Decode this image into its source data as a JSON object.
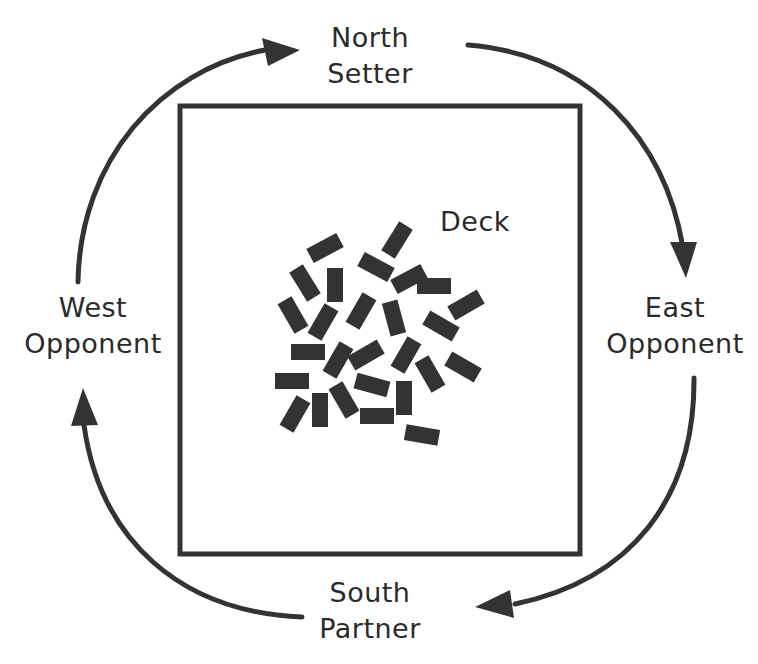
{
  "diagram": {
    "title": "",
    "players": {
      "north": {
        "position": "North",
        "role": "Setter"
      },
      "east": {
        "position": "East",
        "role": "Opponent"
      },
      "south": {
        "position": "South",
        "role": "Partner"
      },
      "west": {
        "position": "West",
        "role": "Opponent"
      }
    },
    "center": {
      "label": "Deck"
    },
    "play_direction": "clockwise",
    "flow": [
      "North",
      "East",
      "South",
      "West"
    ],
    "colors": {
      "ink": "#2a2a2a",
      "tile": "#333333",
      "background": "#ffffff"
    }
  }
}
